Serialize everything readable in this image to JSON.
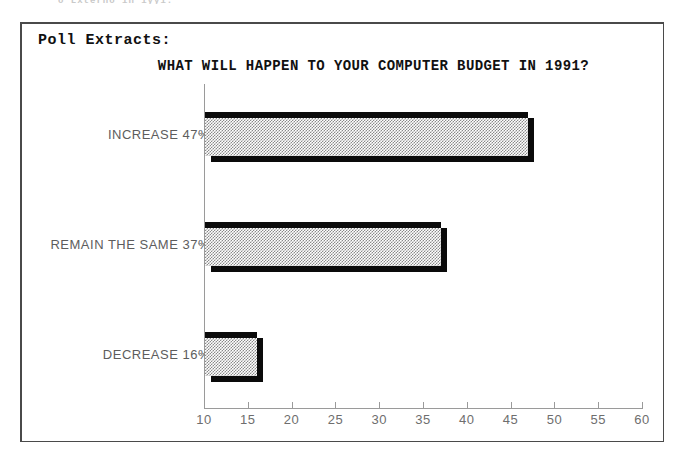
{
  "scan_remnant_text": "o Lxterno in iyyi.",
  "panel": {
    "heading": "Poll Extracts:"
  },
  "chart_data": {
    "type": "bar",
    "orientation": "horizontal",
    "title": "WHAT WILL HAPPEN TO YOUR COMPUTER BUDGET IN 1991?",
    "xlabel": "",
    "ylabel": "",
    "categories": [
      "INCREASE",
      "REMAIN THE SAME",
      "DECREASE"
    ],
    "values": [
      47,
      37,
      16
    ],
    "value_unit": "%",
    "bar_labels": [
      "INCREASE 47%",
      "REMAIN THE SAME 37%",
      "DECREASE 16%"
    ],
    "xlim": [
      10,
      60
    ],
    "xticks": [
      10,
      15,
      20,
      25,
      30,
      35,
      40,
      45,
      50,
      55,
      60
    ],
    "xtick_labels": [
      "10",
      "15",
      "20",
      "25",
      "30",
      "35",
      "40",
      "45",
      "50",
      "55",
      "60"
    ],
    "grid": false,
    "legend": null,
    "style": {
      "bar_fill": "#8a8a8a",
      "bar_fill_pattern": "dither-checker",
      "bar_edge": "#0a0a0a",
      "axis_color": "#9a9a9a",
      "text_color": "#5d5d5d",
      "frame_color": "#4a4a4a",
      "background": "#ffffff"
    }
  }
}
